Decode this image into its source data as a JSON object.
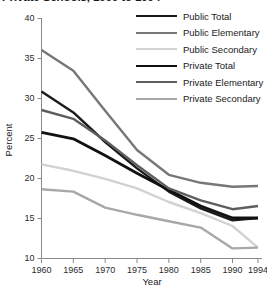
{
  "title": "Private Schools, 1960 to 1994",
  "chart_data": {
    "type": "line",
    "title": "Private Schools, 1960 to 1994",
    "xlabel": "Year",
    "ylabel": "Percent",
    "xlim": [
      1960,
      1994
    ],
    "ylim": [
      10,
      40
    ],
    "yticks": [
      10,
      15,
      20,
      25,
      30,
      35,
      40
    ],
    "xticks": [
      1960,
      1965,
      1970,
      1975,
      1980,
      1985,
      1990,
      1994
    ],
    "grid": false,
    "legend_position": "top-right",
    "x": [
      1960,
      1965,
      1970,
      1975,
      1980,
      1985,
      1990,
      1994
    ],
    "series": [
      {
        "name": "Public Total",
        "color": "#1a1a1a",
        "width": 2.4,
        "values": [
          30.8,
          28.2,
          24.5,
          21.2,
          18.3,
          16.2,
          14.7,
          15.0
        ]
      },
      {
        "name": "Public Elementary",
        "color": "#777777",
        "width": 2.4,
        "values": [
          36.0,
          33.4,
          28.4,
          23.5,
          20.4,
          19.4,
          18.9,
          19.0
        ]
      },
      {
        "name": "Public Secondary",
        "color": "#d2d2d2",
        "width": 2.4,
        "values": [
          21.7,
          20.9,
          19.9,
          18.7,
          17.0,
          15.6,
          14.0,
          11.3
        ]
      },
      {
        "name": "Private Total",
        "color": "#111111",
        "width": 2.8,
        "values": [
          25.7,
          24.9,
          22.8,
          20.6,
          18.5,
          16.5,
          15.0,
          15.0
        ]
      },
      {
        "name": "Private Elementary",
        "color": "#5e5e5e",
        "width": 2.4,
        "values": [
          28.5,
          27.4,
          24.7,
          21.6,
          18.7,
          17.2,
          16.1,
          16.5
        ]
      },
      {
        "name": "Private Secondary",
        "color": "#a8a8a8",
        "width": 2.4,
        "values": [
          18.6,
          18.3,
          16.3,
          15.4,
          14.6,
          13.8,
          11.2,
          11.3
        ]
      }
    ]
  },
  "legend": {
    "items": [
      {
        "label": "Public Total"
      },
      {
        "label": "Public Elementary"
      },
      {
        "label": "Public Secondary"
      },
      {
        "label": "Private Total"
      },
      {
        "label": "Private Elementary"
      },
      {
        "label": "Private Secondary"
      }
    ]
  }
}
